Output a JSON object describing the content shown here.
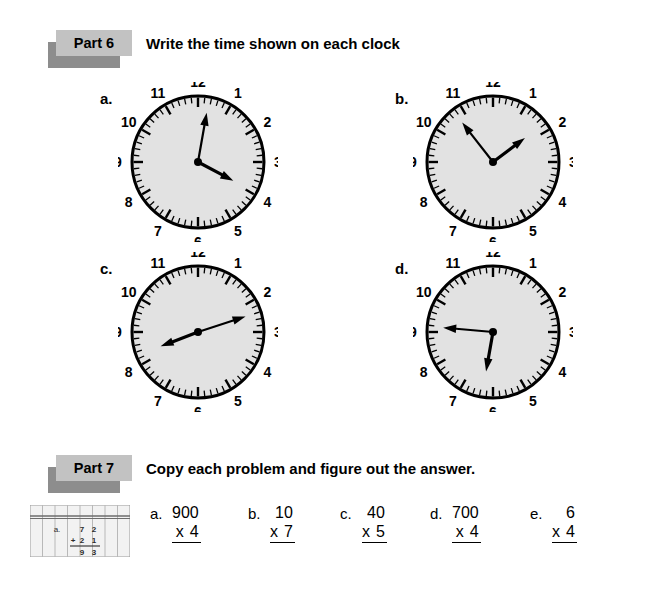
{
  "page": {
    "background": "#ffffff",
    "width": 653,
    "height": 602
  },
  "colors": {
    "tag_fill": "#c2c2c2",
    "tag_shadow": "#8d8d8d",
    "clock_face": "#e2e2e2",
    "ink": "#000000"
  },
  "part6": {
    "tag": "Part 6",
    "title": "Write the time shown on each clock",
    "clocks": [
      {
        "letter": "a.",
        "numerals": [
          "12",
          "1",
          "2",
          "3",
          "4",
          "5",
          "6",
          "7",
          "8",
          "9",
          "10",
          "11"
        ],
        "hour_hand_deg": 118,
        "minute_hand_deg": 10,
        "reading": "hour hand near 4, minute hand just past 12"
      },
      {
        "letter": "b.",
        "numerals": [
          "12",
          "1",
          "2",
          "3",
          "4",
          "5",
          "6",
          "7",
          "8",
          "9",
          "10",
          "11"
        ],
        "hour_hand_deg": 53,
        "minute_hand_deg": 322,
        "reading": "hour hand near 1:45, minute hand near 10:45"
      },
      {
        "letter": "c.",
        "numerals": [
          "12",
          "1",
          "2",
          "3",
          "4",
          "5",
          "6",
          "7",
          "8",
          "9",
          "10",
          "11"
        ],
        "hour_hand_deg": 249,
        "minute_hand_deg": 72,
        "reading": "hour hand near 8:20, minute hand near 2:25"
      },
      {
        "letter": "d.",
        "numerals": [
          "12",
          "1",
          "2",
          "3",
          "4",
          "5",
          "6",
          "7",
          "8",
          "9",
          "10",
          "11"
        ],
        "hour_hand_deg": 190,
        "minute_hand_deg": 275,
        "reading": "hour hand near 6, minute hand on 9"
      }
    ]
  },
  "part7": {
    "tag": "Part 7",
    "title": "Copy each problem and figure out the answer.",
    "thumbnail": {
      "name": "lined-column-paper-example",
      "example_top": "72",
      "example_bottom": "21",
      "example_operator": "+",
      "example_answer": "93",
      "row_letter": "a."
    },
    "problems": [
      {
        "letter": "a.",
        "top": "900",
        "operator": "x",
        "bottom": "4"
      },
      {
        "letter": "b.",
        "top": "10",
        "operator": "x",
        "bottom": "7"
      },
      {
        "letter": "c.",
        "top": "40",
        "operator": "x",
        "bottom": "5"
      },
      {
        "letter": "d.",
        "top": "700",
        "operator": "x",
        "bottom": "4"
      },
      {
        "letter": "e.",
        "top": "6",
        "operator": "x",
        "bottom": "4"
      }
    ]
  }
}
